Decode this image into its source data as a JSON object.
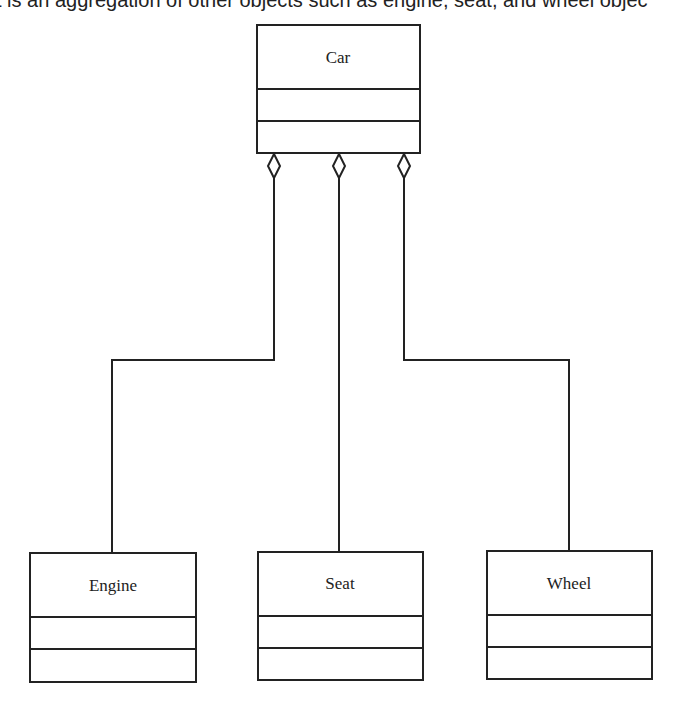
{
  "caption": "t is an aggregation of other objects such as engine, seat, and wheel objec",
  "diagram": {
    "type": "UML class diagram - aggregation",
    "parent": {
      "name": "Car"
    },
    "children": [
      {
        "name": "Engine"
      },
      {
        "name": "Seat"
      },
      {
        "name": "Wheel"
      }
    ],
    "relationship": "aggregation (hollow diamond at Car)",
    "stroke_color": "#222222"
  }
}
